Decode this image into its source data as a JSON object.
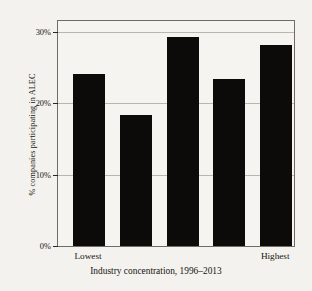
{
  "chart_data": {
    "type": "bar",
    "title": "",
    "subtitle": "",
    "xlabel": "Industry concentration, 1996–2013",
    "ylabel": "% companies participating in ALEC",
    "categories": [
      "Lowest",
      "",
      "",
      "",
      "Highest"
    ],
    "visible_category_labels": [
      "Lowest",
      "Highest"
    ],
    "values": [
      24.1,
      18.4,
      29.2,
      23.4,
      28.2
    ],
    "ylim": [
      0,
      31.5
    ],
    "ytick_values": [
      0,
      10,
      20,
      30
    ],
    "ytick_labels": [
      "0%",
      "10%",
      "20%",
      "30%"
    ],
    "grid": "horizontal",
    "legend": "none",
    "bar_color": "#0d0b09",
    "background_color": "#f4f2ee",
    "gridline_color": "#b9b6b0",
    "axis_color": "#6f6c66"
  },
  "ticks": {
    "t0": "0%",
    "t1": "10%",
    "t2": "20%",
    "t3": "30%"
  },
  "axes": {
    "x_title": "Industry concentration, 1996–2013",
    "y_title": "% companies participating in ALEC",
    "cat_first": "Lowest",
    "cat_last": "Highest"
  }
}
